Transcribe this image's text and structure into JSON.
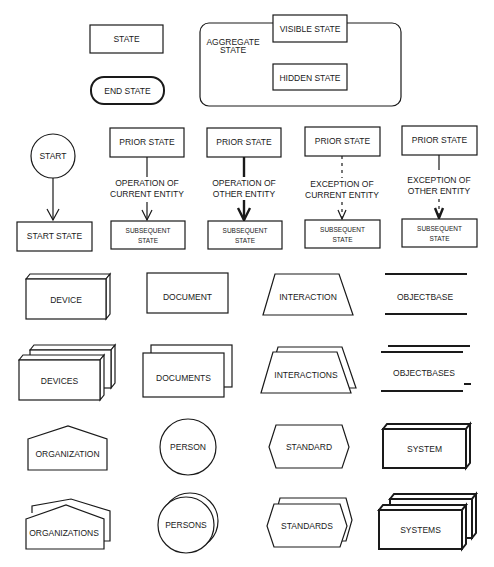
{
  "legend": {
    "state": "STATE",
    "end_state": "END STATE",
    "aggregate_state": [
      "AGGREGATE",
      "STATE"
    ],
    "visible_state": "VISIBLE STATE",
    "hidden_state": "HIDDEN STATE"
  },
  "transitions": {
    "start": "START",
    "start_state": "START STATE",
    "columns": [
      {
        "prior": "PRIOR STATE",
        "label": [
          "OPERATION  OF",
          "CURRENT ENTITY"
        ],
        "subsequent": [
          "SUBSEQUENT",
          "STATE"
        ],
        "line_style": "solid-thin"
      },
      {
        "prior": "PRIOR STATE",
        "label": [
          "OPERATION OF",
          "OTHER ENTITY"
        ],
        "subsequent": [
          "SUBSEQUENT",
          "STATE"
        ],
        "line_style": "solid-bold"
      },
      {
        "prior": "PRIOR STATE",
        "label": [
          "EXCEPTION OF",
          "CURRENT ENTITY"
        ],
        "subsequent": [
          "SUBSEQUENT",
          "STATE"
        ],
        "line_style": "dashed-thin"
      },
      {
        "prior": "PRIOR STATE",
        "label": [
          "EXCEPTION OF",
          "OTHER ENTITY"
        ],
        "subsequent": [
          "SUBSEQUENT",
          "STATE"
        ],
        "line_style": "solid-then-dashed"
      }
    ]
  },
  "symbols": {
    "device": "DEVICE",
    "devices": "DEVICES",
    "document": "DOCUMENT",
    "documents": "DOCUMENTS",
    "interaction": "INTERACTION",
    "interactions": "INTERACTIONS",
    "objectbase": "OBJECTBASE",
    "objectbases": "OBJECTBASES",
    "organization": "ORGANIZATION",
    "organizations": "ORGANIZATIONS",
    "person": "PERSON",
    "persons": "PERSONS",
    "standard": "STANDARD",
    "standards": "STANDARDS",
    "system": "SYSTEM",
    "systems": "SYSTEMS"
  },
  "colors": {
    "ink": "#1a1a1a",
    "paper": "#ffffff"
  }
}
